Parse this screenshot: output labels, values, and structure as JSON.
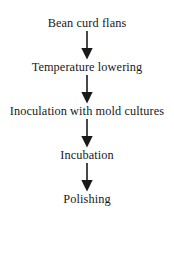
{
  "diagram": {
    "type": "vertical-flowchart",
    "orientation": "top-to-bottom",
    "background_color": "#ffffff",
    "text_color": "#191919",
    "arrow_color": "#1a1a1a",
    "steps": [
      {
        "id": "step-1",
        "label": "Bean curd flans"
      },
      {
        "id": "step-2",
        "label": "Temperature lowering"
      },
      {
        "id": "step-3",
        "label": "Inoculation with mold cultures"
      },
      {
        "id": "step-4",
        "label": "Incubation"
      },
      {
        "id": "step-5",
        "label": "Polishing"
      }
    ],
    "connectors": [
      {
        "id": "arrow-1",
        "from": "step-1",
        "to": "step-2",
        "icon": "arrow-down-icon"
      },
      {
        "id": "arrow-2",
        "from": "step-2",
        "to": "step-3",
        "icon": "arrow-down-icon"
      },
      {
        "id": "arrow-3",
        "from": "step-3",
        "to": "step-4",
        "icon": "arrow-down-icon"
      },
      {
        "id": "arrow-4",
        "from": "step-4",
        "to": "step-5",
        "icon": "arrow-down-icon"
      }
    ]
  }
}
